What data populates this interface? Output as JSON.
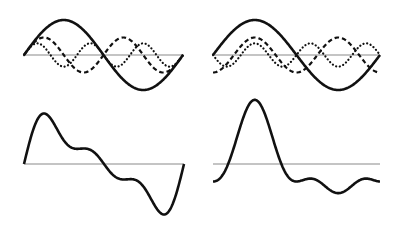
{
  "figure": {
    "background": "#ffffff",
    "curve_color": "#111111",
    "axis_color": "#8a8a8a",
    "panels": [
      {
        "id": "top-left",
        "role": "components",
        "x0": 24,
        "x1": 183,
        "baseline_y": 55,
        "scale": 35,
        "components": [
          {
            "name": "fundamental",
            "style": "solid",
            "harmonic": 1,
            "amp": 1.0,
            "func": "sin",
            "phase": 0
          },
          {
            "name": "second-harmonic",
            "style": "dashed",
            "harmonic": 2,
            "amp": 0.5,
            "func": "sin",
            "phase": 0
          },
          {
            "name": "third-harmonic",
            "style": "dotted",
            "harmonic": 3,
            "amp": 0.3333,
            "func": "sin",
            "phase": 0
          }
        ]
      },
      {
        "id": "top-right",
        "role": "components",
        "x0": 213,
        "x1": 380,
        "baseline_y": 55,
        "scale": 35,
        "components": [
          {
            "name": "fundamental",
            "style": "solid",
            "harmonic": 1,
            "amp": 1.0,
            "func": "sin",
            "phase": 0
          },
          {
            "name": "second-harmonic",
            "style": "dashed",
            "harmonic": 2,
            "amp": -0.5,
            "func": "cos",
            "phase": 0
          },
          {
            "name": "third-harmonic",
            "style": "dotted",
            "harmonic": 3,
            "amp": -0.3333,
            "func": "sin",
            "phase": 0
          }
        ]
      },
      {
        "id": "bottom-left",
        "role": "sum",
        "sum_of": "top-left",
        "x0": 24,
        "x1": 184,
        "baseline_y": 164,
        "scale": 35,
        "closed_ends": true
      },
      {
        "id": "bottom-right",
        "role": "sum",
        "sum_of": "top-right",
        "x0": 213,
        "x1": 380,
        "baseline_y": 164,
        "scale": 35,
        "closed_ends": false
      }
    ]
  }
}
